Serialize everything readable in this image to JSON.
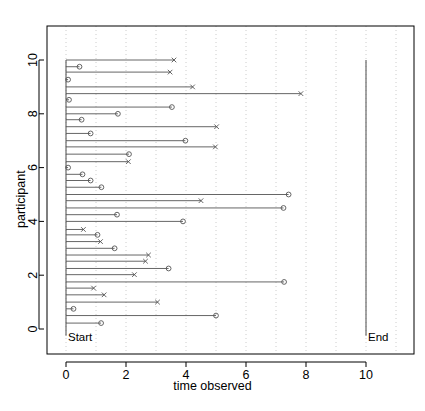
{
  "chart_data": {
    "type": "scatter",
    "title": "",
    "xlabel": "time observed",
    "ylabel": "participant",
    "xlim": [
      -0.45,
      11.4
    ],
    "ylim": [
      -0.55,
      11.2
    ],
    "xticks": [
      0,
      2,
      4,
      6,
      8,
      10
    ],
    "xticklabels": [
      "0",
      "2",
      "4",
      "6",
      "8",
      "10"
    ],
    "yticks": [
      0,
      2,
      4,
      6,
      8,
      10
    ],
    "yticklabels": [
      "0",
      "2",
      "4",
      "6",
      "8",
      "10"
    ],
    "grid": "vertical dotted gridlines at every integer x from 0 to 11",
    "legend": "none",
    "annotations": [
      {
        "name": "start-annotation",
        "text": "Start",
        "x": 0.0,
        "y": -0.1,
        "align": "left"
      },
      {
        "name": "end-annotation",
        "text": "End",
        "x": 10.0,
        "y": -0.1,
        "align": "left"
      }
    ],
    "reference_lines": [
      {
        "name": "start-line",
        "x": 0.0,
        "y0": -0.25,
        "y1": 10.0,
        "style": "solid"
      },
      {
        "name": "end-line",
        "x": 10.0,
        "y0": -0.25,
        "y1": 10.0,
        "style": "solid"
      }
    ],
    "marker_types": {
      "o": "censored-circle",
      "x": "event-cross"
    },
    "series": [
      {
        "name": "participant-follow-up",
        "x_start": 0.0,
        "points": [
          {
            "y": 10.0,
            "x_end": 3.6,
            "marker": "x"
          },
          {
            "y": 9.75,
            "x_end": 0.45,
            "marker": "o"
          },
          {
            "y": 9.55,
            "x_end": 3.47,
            "marker": "x"
          },
          {
            "y": 9.27,
            "x_end": 0.07,
            "marker": "o"
          },
          {
            "y": 9.0,
            "x_end": 4.22,
            "marker": "x"
          },
          {
            "y": 8.75,
            "x_end": 7.83,
            "marker": "x"
          },
          {
            "y": 8.52,
            "x_end": 0.1,
            "marker": "o"
          },
          {
            "y": 8.25,
            "x_end": 3.53,
            "marker": "o"
          },
          {
            "y": 8.0,
            "x_end": 1.73,
            "marker": "o"
          },
          {
            "y": 7.78,
            "x_end": 0.52,
            "marker": "o"
          },
          {
            "y": 7.52,
            "x_end": 5.02,
            "marker": "x"
          },
          {
            "y": 7.27,
            "x_end": 0.82,
            "marker": "o"
          },
          {
            "y": 7.0,
            "x_end": 3.98,
            "marker": "o"
          },
          {
            "y": 6.77,
            "x_end": 4.98,
            "marker": "x"
          },
          {
            "y": 6.5,
            "x_end": 2.1,
            "marker": "o"
          },
          {
            "y": 6.22,
            "x_end": 2.08,
            "marker": "x"
          },
          {
            "y": 6.0,
            "x_end": 0.07,
            "marker": "o"
          },
          {
            "y": 5.75,
            "x_end": 0.55,
            "marker": "o"
          },
          {
            "y": 5.52,
            "x_end": 0.82,
            "marker": "o"
          },
          {
            "y": 5.27,
            "x_end": 1.18,
            "marker": "o"
          },
          {
            "y": 5.0,
            "x_end": 7.42,
            "marker": "o"
          },
          {
            "y": 4.77,
            "x_end": 4.5,
            "marker": "x"
          },
          {
            "y": 4.5,
            "x_end": 7.25,
            "marker": "o"
          },
          {
            "y": 4.25,
            "x_end": 1.7,
            "marker": "o"
          },
          {
            "y": 4.0,
            "x_end": 3.9,
            "marker": "o"
          },
          {
            "y": 3.7,
            "x_end": 0.58,
            "marker": "x"
          },
          {
            "y": 3.5,
            "x_end": 1.05,
            "marker": "o"
          },
          {
            "y": 3.25,
            "x_end": 1.15,
            "marker": "x"
          },
          {
            "y": 3.0,
            "x_end": 1.62,
            "marker": "o"
          },
          {
            "y": 2.75,
            "x_end": 2.75,
            "marker": "x"
          },
          {
            "y": 2.52,
            "x_end": 2.65,
            "marker": "x"
          },
          {
            "y": 2.25,
            "x_end": 3.42,
            "marker": "o"
          },
          {
            "y": 2.02,
            "x_end": 2.28,
            "marker": "x"
          },
          {
            "y": 1.75,
            "x_end": 7.27,
            "marker": "o"
          },
          {
            "y": 1.52,
            "x_end": 0.92,
            "marker": "x"
          },
          {
            "y": 1.27,
            "x_end": 1.27,
            "marker": "x"
          },
          {
            "y": 1.0,
            "x_end": 3.05,
            "marker": "x"
          },
          {
            "y": 0.75,
            "x_end": 0.25,
            "marker": "o"
          },
          {
            "y": 0.5,
            "x_end": 5.0,
            "marker": "o"
          },
          {
            "y": 0.22,
            "x_end": 1.17,
            "marker": "o"
          }
        ]
      }
    ]
  },
  "axes": {
    "xlabel": "time observed",
    "ylabel": "participant"
  },
  "colors": {
    "line": "#555555",
    "marker": "#555555",
    "grid": "#bfbfbf",
    "frame": "#000000",
    "text": "#000000"
  }
}
